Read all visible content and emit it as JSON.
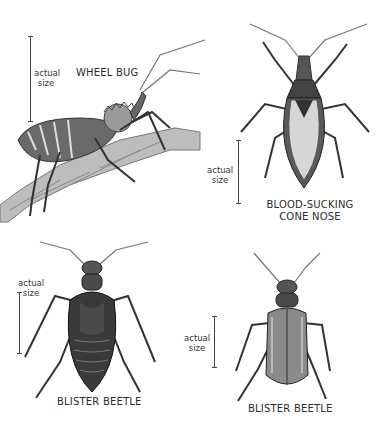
{
  "plate": {
    "specimens": [
      {
        "id": "wheel-bug",
        "name": "WHEEL BUG",
        "size_note": [
          "actual",
          "size"
        ]
      },
      {
        "id": "cone-nose",
        "name": [
          "BLOOD-SUCKING",
          "CONE NOSE"
        ],
        "size_note": [
          "actual",
          "size"
        ]
      },
      {
        "id": "blister-beetle-1",
        "name": "BLISTER BEETLE",
        "size_note": [
          "actual",
          "size"
        ]
      },
      {
        "id": "blister-beetle-2",
        "name": "BLISTER BEETLE",
        "size_note": [
          "actual",
          "size"
        ]
      }
    ]
  },
  "colors": {
    "ink": "#2a2a2a",
    "body_dark": "#3a3a3a",
    "body_mid": "#7a7a7a",
    "body_light": "#c8c8c8",
    "twig": "#8a8a8a",
    "background": "#ffffff"
  }
}
